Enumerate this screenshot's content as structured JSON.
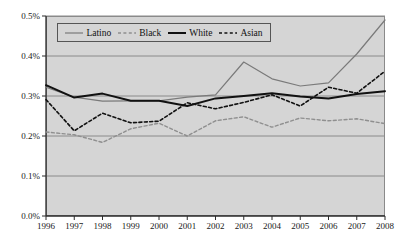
{
  "chart_data": {
    "type": "line",
    "title": "",
    "xlabel": "",
    "ylabel": "",
    "categories": [
      1996,
      1997,
      1998,
      1999,
      2000,
      2001,
      2002,
      2003,
      2004,
      2005,
      2006,
      2007,
      2008
    ],
    "x_tick_labels": [
      "1996",
      "1997",
      "1998",
      "1999",
      "2000",
      "2001",
      "2002",
      "2003",
      "2004",
      "2005",
      "2006",
      "2007",
      "2008"
    ],
    "y_tick_labels": [
      "0.0%",
      "0.1%",
      "0.2%",
      "0.3%",
      "0.4%",
      "0.5%"
    ],
    "y_tick_values": [
      0.0,
      0.1,
      0.2,
      0.3,
      0.4,
      0.5
    ],
    "ylim": [
      0.0,
      0.5
    ],
    "xlim": [
      1996,
      2008
    ],
    "grid": true,
    "grid_axis": "y",
    "legend_position": "top-left-inside",
    "plot_background": "#d5d5d5",
    "grid_color": "#8a8a8a",
    "axis_color": "#2b2b2b",
    "series": [
      {
        "name": "Latino",
        "color": "#7a7a7a",
        "style": "solid",
        "width": 1.2,
        "values": [
          0.322,
          0.297,
          0.287,
          0.288,
          0.288,
          0.297,
          0.303,
          0.385,
          0.343,
          0.325,
          0.333,
          0.405,
          0.49
        ]
      },
      {
        "name": "Black",
        "color": "#8f8f8f",
        "style": "dashed",
        "width": 1.4,
        "values": [
          0.21,
          0.203,
          0.184,
          0.218,
          0.232,
          0.2,
          0.238,
          0.248,
          0.222,
          0.245,
          0.238,
          0.243,
          0.231
        ]
      },
      {
        "name": "White",
        "color": "#111111",
        "style": "solid",
        "width": 2.0,
        "values": [
          0.327,
          0.296,
          0.306,
          0.288,
          0.288,
          0.275,
          0.294,
          0.3,
          0.307,
          0.299,
          0.294,
          0.305,
          0.312
        ]
      },
      {
        "name": "Asian",
        "color": "#111111",
        "style": "dashed",
        "width": 1.6,
        "values": [
          0.291,
          0.213,
          0.257,
          0.233,
          0.237,
          0.283,
          0.268,
          0.284,
          0.303,
          0.275,
          0.322,
          0.307,
          0.362
        ]
      }
    ]
  },
  "legend": {
    "items": [
      {
        "label": "Latino"
      },
      {
        "label": "Black"
      },
      {
        "label": "White"
      },
      {
        "label": "Asian"
      }
    ]
  }
}
